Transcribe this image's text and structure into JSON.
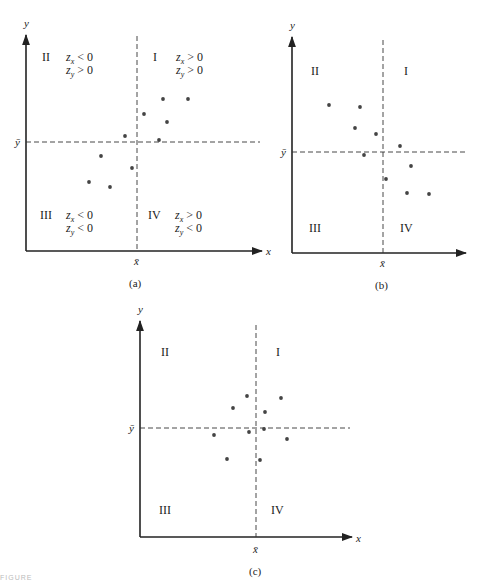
{
  "figure_label": "FIGURE",
  "chart_data": [
    {
      "type": "scatter",
      "panel": "(a)",
      "title": "",
      "xlabel": "x",
      "ylabel": "y",
      "mean_x_label": "x̄",
      "mean_y_label": "ȳ",
      "caption": "(a)",
      "quadrants": [
        {
          "id": "I",
          "label": "I",
          "conditions": [
            "z_x > 0",
            "z_y > 0"
          ]
        },
        {
          "id": "II",
          "label": "II",
          "conditions": [
            "z_x < 0",
            "z_y > 0"
          ]
        },
        {
          "id": "III",
          "label": "III",
          "conditions": [
            "z_x < 0",
            "z_y < 0"
          ]
        },
        {
          "id": "IV",
          "label": "IV",
          "conditions": [
            "z_x > 0",
            "z_y < 0"
          ]
        }
      ],
      "relationship": "positive",
      "points": [
        [
          163,
          99
        ],
        [
          188,
          99
        ],
        [
          144,
          114
        ],
        [
          167,
          122
        ],
        [
          125,
          136
        ],
        [
          159,
          140
        ],
        [
          101,
          156
        ],
        [
          132,
          168
        ],
        [
          89,
          182
        ],
        [
          110,
          187
        ]
      ],
      "grid": false
    },
    {
      "type": "scatter",
      "panel": "(b)",
      "title": "",
      "xlabel": "",
      "ylabel": "y",
      "mean_x_label": "x̄",
      "mean_y_label": "ȳ",
      "caption": "(b)",
      "quadrants": [
        {
          "id": "I",
          "label": "I"
        },
        {
          "id": "II",
          "label": "II"
        },
        {
          "id": "III",
          "label": "III"
        },
        {
          "id": "IV",
          "label": "IV"
        }
      ],
      "relationship": "negative",
      "points": [
        [
          329,
          105
        ],
        [
          360,
          107
        ],
        [
          355,
          128
        ],
        [
          376,
          134
        ],
        [
          400,
          146
        ],
        [
          364,
          155
        ],
        [
          411,
          166
        ],
        [
          386,
          179
        ],
        [
          407,
          193
        ],
        [
          429,
          194
        ]
      ],
      "grid": false
    },
    {
      "type": "scatter",
      "panel": "(c)",
      "title": "",
      "xlabel": "x",
      "ylabel": "y",
      "mean_x_label": "x̄",
      "mean_y_label": "ȳ",
      "caption": "(c)",
      "quadrants": [
        {
          "id": "I",
          "label": "I"
        },
        {
          "id": "II",
          "label": "II"
        },
        {
          "id": "III",
          "label": "III"
        },
        {
          "id": "IV",
          "label": "IV"
        }
      ],
      "relationship": "none",
      "points": [
        [
          247,
          396
        ],
        [
          281,
          398
        ],
        [
          233,
          408
        ],
        [
          265,
          412
        ],
        [
          264,
          429
        ],
        [
          249,
          432
        ],
        [
          214,
          435
        ],
        [
          287,
          439
        ],
        [
          227,
          459
        ],
        [
          260,
          460
        ]
      ],
      "grid": false
    }
  ],
  "panels": {
    "a": {
      "y_label": "y",
      "x_label": "x",
      "xbar": "x̄",
      "ybar": "ȳ",
      "caption": "(a)",
      "q1": "I",
      "q2": "II",
      "q3": "III",
      "q4": "IV",
      "q1_zx": "> 0",
      "q1_zy": "> 0",
      "q2_zx": "< 0",
      "q2_zy": "> 0",
      "q3_zx": "< 0",
      "q3_zy": "< 0",
      "q4_zx": "> 0",
      "q4_zy": "< 0",
      "z": "z",
      "sub_x": "x",
      "sub_y": "y"
    },
    "b": {
      "y_label": "y",
      "xbar": "x̄",
      "ybar": "ȳ",
      "caption": "(b)",
      "q1": "I",
      "q2": "II",
      "q3": "III",
      "q4": "IV"
    },
    "c": {
      "y_label": "y",
      "x_label": "x",
      "xbar": "x̄",
      "ybar": "ȳ",
      "caption": "(c)",
      "q1": "I",
      "q2": "II",
      "q3": "III",
      "q4": "IV"
    }
  },
  "colors": {
    "axis": "#222222",
    "points": "#444444",
    "dashed": "#333333",
    "background": "#ffffff"
  }
}
